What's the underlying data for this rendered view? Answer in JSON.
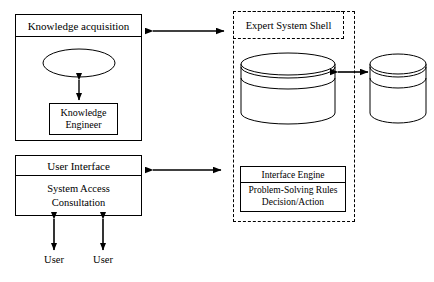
{
  "diagram": {
    "colors": {
      "stroke": "#000000",
      "background": "#ffffff"
    },
    "knowledge_acquisition": {
      "header": "Knowledge acquisition",
      "experts": "Experts",
      "knowledge_engineer_line1": "Knowledge",
      "knowledge_engineer_line2": "Engineer"
    },
    "user_interface": {
      "header": "User Interface",
      "body_line1": "System Access",
      "body_line2": "Consultation",
      "user_left": "User",
      "user_right": "User"
    },
    "shell": {
      "header": "Expert System Shell",
      "knowledge_base": {
        "label": "Knowledge Base",
        "body_line1": "Logical",
        "body_line2": "Data"
      },
      "inference": {
        "header": "Interface Engine",
        "body_line1": "Problem-Solving Rules",
        "body_line2": "Decision/Action"
      }
    },
    "database": {
      "label": "Database",
      "body_line1": "Factual",
      "body_line2": "Data"
    }
  }
}
